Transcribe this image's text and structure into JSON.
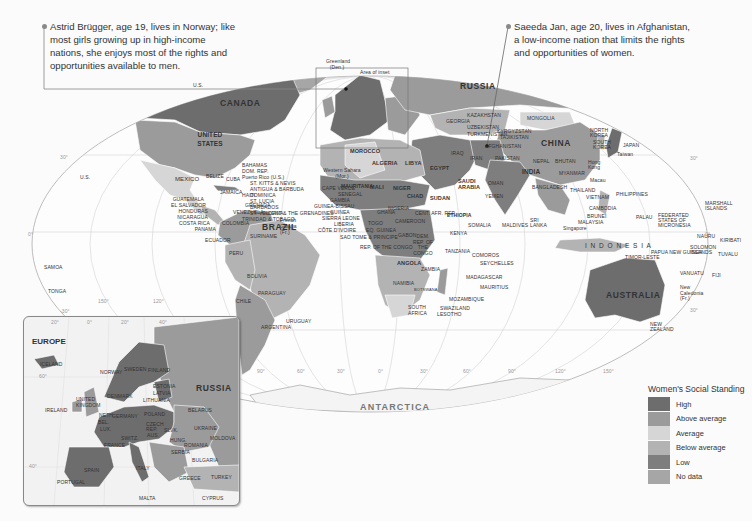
{
  "callouts": [
    {
      "name": "norway-callout",
      "text_lines": [
        "Astrid Brügger, age 19, lives in Norway; like",
        "most girls growing up in high-income",
        "nations, she enjoys most of the rights and",
        "opportunities available to men."
      ]
    },
    {
      "name": "afghanistan-callout",
      "text_lines": [
        "Saeeda Jan, age 20, lives in Afghanistan,",
        "a low-income nation that limits the rights",
        "and opportunities of women."
      ]
    }
  ],
  "map": {
    "continent_labels": {
      "antarctica": "ANTARCTICA"
    },
    "inset_area_label": "Area of inset",
    "major_labels": {
      "canada": "CANADA",
      "united_states": "UNITED STATES",
      "us_alaska": "U.S.",
      "us_hawaii": "U.S.",
      "mexico": "MEXICO",
      "brazil": "BRAZIL",
      "russia": "RUSSIA",
      "china": "CHINA",
      "india": "INDIA",
      "australia": "AUSTRALIA",
      "indonesia": "I N D O N E S I A",
      "greenland": "Greenland (Den.)",
      "algeria": "ALGERIA",
      "libya": "LIBYA",
      "egypt": "EGYPT",
      "sudan": "SUDAN",
      "chad": "CHAD",
      "niger": "NIGER",
      "mali": "MALI",
      "mauritania": "MAURITANIA",
      "morocco": "MOROCCO",
      "western_sahara": "Western Sahara (Mor.)",
      "ethiopia": "ETHIOPIA",
      "somalia": "SOMALIA",
      "kenya": "KENYA",
      "tanzania": "TANZANIA",
      "angola": "ANGOLA",
      "zambia": "ZAMBIA",
      "namibia": "NAMIBIA",
      "botswana": "BOTSWANA",
      "south_africa": "SOUTH AFRICA",
      "madagascar": "MADAGASCAR",
      "mozambique": "MOZAMBIQUE",
      "dem_rep_congo": "DEM. REP. OF THE CONGO",
      "rep_congo": "REP. OF THE CONGO",
      "saudi_arabia": "SAUDI ARABIA",
      "iran": "IRAN",
      "iraq": "IRAQ",
      "kazakhstan": "KAZAKHSTAN",
      "mongolia": "MONGOLIA",
      "afghanistan": "AFGHANISTAN",
      "pakistan": "PAKISTAN",
      "yemen": "YEMEN",
      "oman": "OMAN",
      "japan": "JAPAN",
      "north_korea": "NORTH KOREA",
      "south_korea": "SOUTH KOREA",
      "philippines": "PHILIPPINES",
      "vietnam": "VIETNAM",
      "thailand": "THAILAND",
      "cambodia": "CAMBODIA",
      "malaysia": "MALAYSIA",
      "myanmar": "MYANMAR",
      "bangladesh": "BANGLADESH",
      "sri_lanka": "SRI LANKA",
      "maldives": "MALDIVES",
      "papua_new_guinea": "PAPUA NEW GUINEA",
      "new_zealand": "NEW ZEALAND",
      "new_caledonia": "New Caledonia (Fr.)",
      "solomon_islands": "SOLOMON ISLANDS",
      "vanuatu": "VANUATU",
      "fiji": "FIJI",
      "palau": "PALAU",
      "micronesia": "FEDERATED STATES OF MICRONESIA",
      "marshall_islands": "MARSHALL ISLANDS",
      "kiribati": "KIRIBATI",
      "nauru": "NAURU",
      "tuvalu": "TUVALU",
      "timor_leste": "TIMOR-LESTE",
      "peru": "PERU",
      "bolivia": "BOLIVIA",
      "chile": "CHILE",
      "argentina": "ARGENTINA",
      "paraguay": "PARAGUAY",
      "uruguay": "URUGUAY",
      "colombia": "COLOMBIA",
      "venezuela": "VENEZUELA",
      "ecuador": "ECUADOR",
      "suriname": "SURINAME",
      "french_guiana": "French Guiana (Fr.)",
      "guyana": "GUYANA",
      "samoa": "SAMOA",
      "tonga": "TONGA",
      "comoros": "COMOROS",
      "seychelles": "SEYCHELLES",
      "mauritius": "MAURITIUS",
      "swaziland": "SWAZILAND",
      "lesotho": "LESOTHO",
      "taiwan": "Taiwan",
      "hong_kong": "Hong Kong",
      "macau": "Macau",
      "singapore": "Singapore",
      "brunei": "BRUNEI",
      "kyrgyzstan": "KYRGYZSTAN",
      "tajikistan": "TAJIKISTAN",
      "turkmenistan": "TURKMENISTAN",
      "uzbekistan": "UZBEKISTAN",
      "georgia": "GEORGIA",
      "bhutan": "BHUTAN",
      "nepal": "NEPAL"
    },
    "caribbean_labels": [
      "BAHAMAS",
      "DOM. REP.",
      "Puerto Rico (U.S.)",
      "ST. KITTS & NEVIS",
      "ANTIGUA & BARBUDA",
      "DOMINICA",
      "ST. LUCIA",
      "BARBADOS",
      "ST. VINCENT & THE GRENADINES",
      "TRINIDAD & TOBAGO",
      "GRENADA",
      "HAITI",
      "JAMAICA",
      "CUBA",
      "BELIZE"
    ],
    "central_america_labels": [
      "GUATEMALA",
      "EL SALVADOR",
      "HONDURAS",
      "NICARAGUA",
      "COSTA RICA",
      "PANAMA"
    ],
    "west_africa_labels": [
      "CAPE VERDE",
      "SENEGAL",
      "GAMBIA",
      "GUINEA-BISSAU",
      "GUINEA",
      "SIERRA LEONE",
      "LIBERIA",
      "CÔTE D'IVOIRE",
      "TOGO",
      "EQ. GUINEA",
      "SAO TOME & PRINCIPE",
      "GHANA",
      "NIGERIA",
      "CAMEROON",
      "CENT. AFR. REP.",
      "GABON"
    ],
    "degree_labels": {
      "lat_30n_left": "30°",
      "lat_0_left": "0°",
      "lat_30s_left": "-30°",
      "lat_30n_right": "30°",
      "lat_0_right": "0°",
      "lat_30s_right": "30°",
      "lon_150w": "150°",
      "lon_120w": "120°",
      "lon_90w": "90°",
      "lon_60w": "60°",
      "lon_30w": "30°",
      "lon_0": "0°",
      "lon_30e": "30°",
      "lon_60e": "60°",
      "lon_90e": "90°",
      "lon_120e": "120°",
      "lon_150e": "150°"
    }
  },
  "inset": {
    "title": "EUROPE",
    "degree_labels": [
      "20°",
      "0°",
      "20°",
      "40°",
      "60°",
      "40°"
    ],
    "labels": {
      "russia": "RUSSIA",
      "iceland": "ICELAND",
      "ireland": "IRELAND",
      "united_kingdom": "UNITED KINGDOM",
      "norway": "NORWAY",
      "sweden": "SWEDEN",
      "finland": "FINLAND",
      "denmark": "DENMARK",
      "germany": "GERMANY",
      "poland": "POLAND",
      "france": "FRANCE",
      "spain": "SPAIN",
      "portugal": "PORTUGAL",
      "italy": "ITALY",
      "belarus": "BELARUS",
      "ukraine": "UKRAINE",
      "moldova": "MOLDOVA",
      "romania": "ROMANIA",
      "bulgaria": "BULGARIA",
      "turkey": "TURKEY",
      "greece": "GREECE",
      "switz": "SWITZ.",
      "aus": "AUS.",
      "czech": "CZECH REP.",
      "slovakia": "SLVK.",
      "hungary": "HUNG.",
      "serbia": "SERBIA",
      "lux": "LUX.",
      "bel": "BEL.",
      "neth": "NETH.",
      "estonia": "ESTONIA",
      "latvia": "LATVIA",
      "lithuania": "LITHUANIA",
      "malta": "MALTA",
      "cyprus": "CYPRUS"
    }
  },
  "legend": {
    "title": "Women's Social Standing",
    "items": [
      {
        "label": "High",
        "color": "#6d6d6d"
      },
      {
        "label": "Above average",
        "color": "#9b9b9b"
      },
      {
        "label": "Average",
        "color": "#d6d6d6"
      },
      {
        "label": "Below average",
        "color": "#b3b3b3"
      },
      {
        "label": "Low",
        "color": "#7e7e7e"
      },
      {
        "label": "No data",
        "color": "#a6a6a6"
      }
    ]
  },
  "colors": {
    "high": "#6d6d6d",
    "above_average": "#9b9b9b",
    "average": "#d6d6d6",
    "below_average": "#b3b3b3",
    "low": "#7e7e7e",
    "no_data": "#a6a6a6",
    "ocean": "#fbfbfb",
    "graticule": "#cfcfcf"
  }
}
